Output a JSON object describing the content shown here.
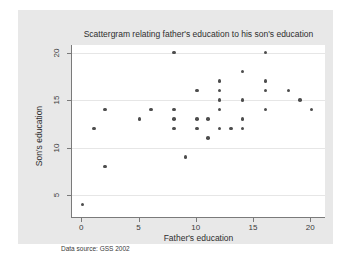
{
  "chart_data": {
    "type": "scatter",
    "title": "Scattergram relating father's education to his son's education",
    "xlabel": "Father's education",
    "ylabel": "Son's education",
    "note": "Data source:  GSS 2002",
    "xlim": [
      -0.9,
      21.2
    ],
    "ylim": [
      2.7,
      20.8
    ],
    "xticks": [
      0,
      5,
      10,
      15,
      20
    ],
    "yticks": [
      5,
      10,
      15,
      20
    ],
    "xticklabels": [
      "0",
      "5",
      "10",
      "15",
      "20"
    ],
    "yticklabels": [
      "5",
      "10",
      "15",
      "20"
    ],
    "grid": "horizontal",
    "gridlines_y": [
      5,
      10,
      15,
      20
    ],
    "legend": null,
    "marker_color": "#4d4d4d",
    "plot_background": "#ffffff",
    "graph_background": "#e8e8e8",
    "points": [
      {
        "x": 0,
        "y": 4
      },
      {
        "x": 1,
        "y": 12
      },
      {
        "x": 2,
        "y": 14
      },
      {
        "x": 2,
        "y": 8
      },
      {
        "x": 5,
        "y": 13
      },
      {
        "x": 6,
        "y": 14
      },
      {
        "x": 8,
        "y": 20
      },
      {
        "x": 8,
        "y": 14
      },
      {
        "x": 8,
        "y": 13
      },
      {
        "x": 8,
        "y": 12
      },
      {
        "x": 9,
        "y": 9
      },
      {
        "x": 10,
        "y": 16
      },
      {
        "x": 10,
        "y": 13
      },
      {
        "x": 10,
        "y": 12
      },
      {
        "x": 11,
        "y": 13
      },
      {
        "x": 11,
        "y": 11
      },
      {
        "x": 12,
        "y": 17
      },
      {
        "x": 12,
        "y": 16
      },
      {
        "x": 12,
        "y": 15
      },
      {
        "x": 12,
        "y": 14
      },
      {
        "x": 12,
        "y": 12
      },
      {
        "x": 13,
        "y": 12
      },
      {
        "x": 14,
        "y": 18
      },
      {
        "x": 14,
        "y": 15
      },
      {
        "x": 14,
        "y": 13
      },
      {
        "x": 14,
        "y": 12
      },
      {
        "x": 16,
        "y": 20
      },
      {
        "x": 16,
        "y": 17
      },
      {
        "x": 16,
        "y": 16
      },
      {
        "x": 16,
        "y": 14
      },
      {
        "x": 18,
        "y": 16
      },
      {
        "x": 19,
        "y": 15
      },
      {
        "x": 20,
        "y": 14
      }
    ]
  }
}
